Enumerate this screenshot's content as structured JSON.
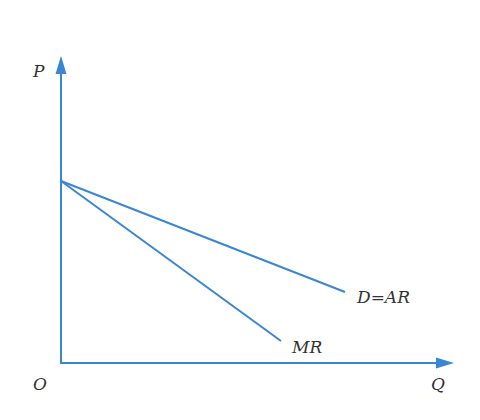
{
  "diagram": {
    "type": "economics-revenue-curves",
    "colors": {
      "axis": "#3a86d4",
      "line": "#3a86d4",
      "text": "#333333",
      "background": "#ffffff"
    },
    "axes": {
      "y_label": "P",
      "x_label": "Q",
      "origin_label": "O",
      "origin": [
        61,
        363
      ],
      "y_end": [
        61,
        58
      ],
      "x_end": [
        452,
        363
      ]
    },
    "lines": [
      {
        "name": "demand",
        "label": "D=AR",
        "start": [
          61,
          181
        ],
        "end": [
          345,
          292
        ],
        "label_pos": [
          357,
          304
        ]
      },
      {
        "name": "marginal-revenue",
        "label": "MR",
        "start": [
          61,
          181
        ],
        "end": [
          281,
          341
        ],
        "label_pos": [
          292,
          353
        ]
      }
    ]
  }
}
